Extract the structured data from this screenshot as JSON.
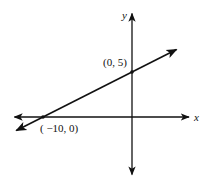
{
  "chart_data": {
    "type": "line",
    "title": "",
    "xlabel": "x",
    "ylabel": "y",
    "xlim": [
      -13.2,
      6.4
    ],
    "ylim": [
      -6.4,
      11.5
    ],
    "grid": false,
    "series": [
      {
        "name": "line through (-10, 0) and (0, 5)",
        "slope": 0.5,
        "intercept": 5,
        "x_range": [
          -13,
          5
        ]
      }
    ],
    "points": [
      {
        "x": 0,
        "y": 5,
        "label": "(0, 5)"
      },
      {
        "x": -10,
        "y": 0,
        "label": "( −10, 0)"
      }
    ],
    "color": "#111111"
  }
}
